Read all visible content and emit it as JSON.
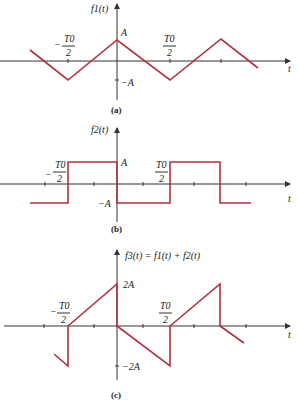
{
  "colors": {
    "waveform": "#b0323f",
    "axis": "#333333",
    "text": "#222222"
  },
  "panels": [
    {
      "id": "a",
      "caption": "(a)",
      "ylabel": "f1(t)",
      "xlabel": "t",
      "level_pos": "A",
      "level_neg": "−A",
      "tick_neg_label": {
        "sign": "−",
        "num": "T0",
        "den": "2"
      },
      "tick_pos_label": {
        "num": "T0",
        "den": "2"
      },
      "axis_y": 61,
      "points": "30,50 68,80 117,40 170,80 221,39 258,68"
    },
    {
      "id": "b",
      "caption": "(b)",
      "ylabel": "f2(t)",
      "xlabel": "t",
      "level_pos": "A",
      "level_neg": "−A",
      "tick_neg_label": {
        "sign": "−",
        "num": "T0",
        "den": "2"
      },
      "tick_pos_label": {
        "num": "T0",
        "den": "2"
      },
      "axis_y": 184,
      "points": "30,203 68,203 68,162 117,162 117,203 170,203 170,162 220,162 220,203 251,203"
    },
    {
      "id": "c",
      "caption": "(c)",
      "ylabel": "f3(t) = f1(t) + f2(t)",
      "xlabel": "t",
      "level_pos": "2A",
      "level_neg": "−2A",
      "tick_neg_label": {
        "sign": "−",
        "num": "T0",
        "den": "2"
      },
      "tick_pos_label": {
        "num": "T0",
        "den": "2"
      },
      "axis_y": 326,
      "points": "54,354 68,366 68,326 117,284 117,326 170,366 170,326 220,284 220,326 244,343"
    }
  ]
}
